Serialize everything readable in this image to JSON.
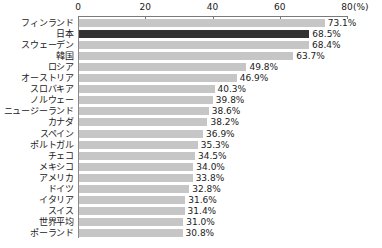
{
  "chart_data": {
    "type": "bar",
    "orientation": "horizontal",
    "title": "",
    "xlabel": "(%)",
    "ylabel": "",
    "xlim": [
      0,
      80
    ],
    "xticks": [
      0,
      20,
      40,
      60,
      80
    ],
    "xtick_labels": [
      "0",
      "20",
      "40",
      "60",
      "80"
    ],
    "unit_label": "(%)",
    "grid": false,
    "legend": null,
    "axis_position": "top",
    "highlight_category": "日本",
    "colors": {
      "bar": "#c6c6c6",
      "bar_highlight": "#333333",
      "axis": "#7a7a7a",
      "text": "#1a1a1a",
      "background": "#ffffff"
    },
    "categories": [
      "フィンランド",
      "日本",
      "スウェーデン",
      "韓国",
      "ロシア",
      "オーストリア",
      "スロバキア",
      "ノルウェー",
      "ニュージーランド",
      "カナダ",
      "スペイン",
      "ポルトガル",
      "チェコ",
      "メキシコ",
      "アメリカ",
      "ドイツ",
      "イタリア",
      "スイス",
      "世界平均",
      "ポーランド"
    ],
    "values": [
      73.1,
      68.5,
      68.4,
      63.7,
      49.8,
      46.9,
      40.3,
      39.8,
      38.6,
      38.2,
      36.9,
      35.3,
      34.5,
      34.0,
      33.8,
      32.8,
      31.6,
      31.4,
      31.0,
      30.8
    ],
    "value_labels": [
      "73.1%",
      "68.5%",
      "68.4%",
      "63.7%",
      "49.8%",
      "46.9%",
      "40.3%",
      "39.8%",
      "38.6%",
      "38.2%",
      "36.9%",
      "35.3%",
      "34.5%",
      "34.0%",
      "33.8%",
      "32.8%",
      "31.6%",
      "31.4%",
      "31.0%",
      "30.8%"
    ]
  }
}
